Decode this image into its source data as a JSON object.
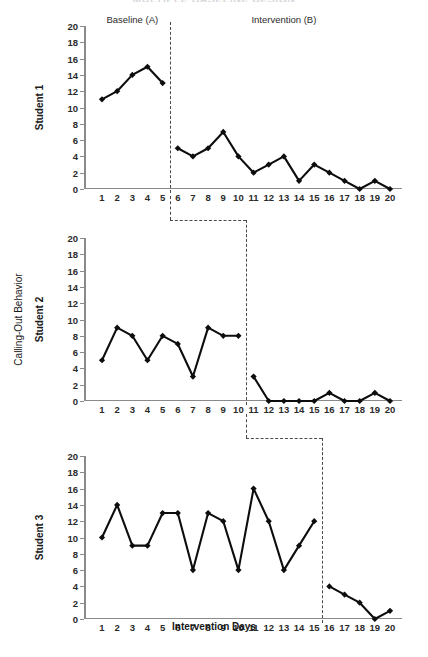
{
  "title": "MULTIPLE BASELINE DESIGN",
  "axis": {
    "x_title": "Intervention Days",
    "y_title": "Calling-Out Behavior",
    "y_ticks": [
      0,
      2,
      4,
      6,
      8,
      10,
      12,
      14,
      16,
      18,
      20
    ],
    "x_ticks": [
      1,
      2,
      3,
      4,
      5,
      6,
      7,
      8,
      9,
      10,
      11,
      12,
      13,
      14,
      15,
      16,
      17,
      18,
      19,
      20
    ]
  },
  "phases": {
    "baseline_label": "Baseline (A)",
    "intervention_label": "Intervention (B)"
  },
  "panels": [
    {
      "name": "Student 1",
      "phase_change_after_day": 5
    },
    {
      "name": "Student 2",
      "phase_change_after_day": 10
    },
    {
      "name": "Student 3",
      "phase_change_after_day": 15
    }
  ],
  "colors": {
    "line": "#0d0d0d",
    "marker": "#0d0d0d",
    "axis": "#8a8a8a",
    "phase_line": "#4a4a4a",
    "background": "#ffffff"
  },
  "chart_data": {
    "type": "line",
    "title": "MULTIPLE BASELINE DESIGN",
    "xlabel": "Intervention Days",
    "ylabel": "Calling-Out Behavior",
    "xlim": [
      1,
      20
    ],
    "ylim": [
      0,
      20
    ],
    "ytick_step": 2,
    "grid": false,
    "legend": "none",
    "x": [
      1,
      2,
      3,
      4,
      5,
      6,
      7,
      8,
      9,
      10,
      11,
      12,
      13,
      14,
      15,
      16,
      17,
      18,
      19,
      20
    ],
    "series": [
      {
        "name": "Student 1",
        "phase_change_after_day": 5,
        "baseline_days": [
          1,
          2,
          3,
          4,
          5
        ],
        "baseline_values": [
          11,
          12,
          14,
          15,
          13
        ],
        "intervention_days": [
          6,
          7,
          8,
          9,
          10,
          11,
          12,
          13,
          14,
          15,
          16,
          17,
          18,
          19,
          20
        ],
        "intervention_values": [
          5,
          4,
          5,
          7,
          4,
          2,
          3,
          4,
          1,
          3,
          2,
          1,
          0,
          1,
          0
        ],
        "values": [
          11,
          12,
          14,
          15,
          13,
          5,
          4,
          5,
          7,
          4,
          2,
          3,
          4,
          1,
          3,
          2,
          1,
          0,
          1,
          0
        ]
      },
      {
        "name": "Student 2",
        "phase_change_after_day": 10,
        "baseline_days": [
          1,
          2,
          3,
          4,
          5,
          6,
          7,
          8,
          9,
          10
        ],
        "baseline_values": [
          5,
          9,
          8,
          5,
          8,
          7,
          3,
          9,
          8,
          8
        ],
        "intervention_days": [
          11,
          12,
          13,
          14,
          15,
          16,
          17,
          18,
          19,
          20
        ],
        "intervention_values": [
          3,
          0,
          0,
          0,
          0,
          1,
          0,
          0,
          1,
          0
        ],
        "values": [
          5,
          9,
          8,
          5,
          8,
          7,
          3,
          9,
          8,
          8,
          3,
          0,
          0,
          0,
          0,
          1,
          0,
          0,
          1,
          0
        ]
      },
      {
        "name": "Student 3",
        "phase_change_after_day": 15,
        "baseline_days": [
          1,
          2,
          3,
          4,
          5,
          6,
          7,
          8,
          9,
          10,
          11,
          12,
          13,
          14,
          15
        ],
        "baseline_values": [
          10,
          14,
          9,
          9,
          13,
          13,
          6,
          13,
          12,
          6,
          16,
          12,
          6,
          9,
          12
        ],
        "intervention_days": [
          16,
          17,
          18,
          19,
          20
        ],
        "intervention_values": [
          4,
          3,
          2,
          0,
          1
        ],
        "values": [
          10,
          14,
          9,
          9,
          13,
          13,
          6,
          13,
          12,
          6,
          16,
          12,
          6,
          9,
          12,
          4,
          3,
          2,
          0,
          1
        ]
      }
    ]
  }
}
